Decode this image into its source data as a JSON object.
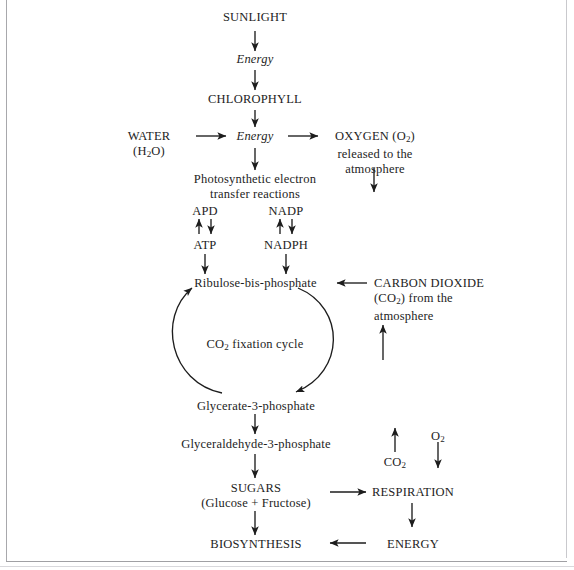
{
  "diagram": {
    "nodes": {
      "sunlight": "SUNLIGHT",
      "energy_top": "Energy",
      "chlorophyll": "CHLOROPHYLL",
      "water_line1": "WATER",
      "water_line2": "(H₂O)",
      "energy_mid": "Energy",
      "oxygen_line1": "OXYGEN (O₂)",
      "oxygen_line2": "released to the",
      "oxygen_line3": "atmosphere",
      "pser_line1": "Photosynthetic electron",
      "pser_line2": "transfer reactions",
      "apd": "APD",
      "atp": "ATP",
      "nadp": "NADP",
      "nadph": "NADPH",
      "ribulose": "Ribulose-bis-phosphate",
      "carbon_dioxide_line1": "CARBON DIOXIDE",
      "carbon_dioxide_line2": "(CO₂) from the",
      "carbon_dioxide_line3": "atmosphere",
      "cycle_label": "CO₂ fixation cycle",
      "glycerate": "Glycerate-3-phosphate",
      "glyceraldehyde": "Glyceraldehyde-3-phosphate",
      "sugars_line1": "SUGARS",
      "sugars_line2": "(Glucose + Fructose)",
      "biosynthesis": "BIOSYNTHESIS",
      "respiration": "RESPIRATION",
      "energy_bottom": "ENERGY",
      "co2_resp": "CO₂",
      "o2_resp": "O₂"
    },
    "colors": {
      "ink": "#1d1d1d",
      "frame": "#a8a8ac",
      "background": "#ffffff"
    },
    "edges": [
      {
        "name": "sunlight-to-energy",
        "type": "arrow-down"
      },
      {
        "name": "energy-to-chlorophyll",
        "type": "arrow-down"
      },
      {
        "name": "chlorophyll-to-energy-mid",
        "type": "arrow-down"
      },
      {
        "name": "water-to-energy-mid",
        "type": "arrow-right"
      },
      {
        "name": "energy-mid-to-oxygen",
        "type": "arrow-right"
      },
      {
        "name": "energy-mid-to-reactions",
        "type": "arrow-down"
      },
      {
        "name": "oxygen-out",
        "type": "arrow-down"
      },
      {
        "name": "apd-atp-up",
        "type": "arrow-up"
      },
      {
        "name": "apd-atp-down",
        "type": "arrow-down"
      },
      {
        "name": "nadp-nadph-up",
        "type": "arrow-up"
      },
      {
        "name": "nadp-nadph-down",
        "type": "arrow-down"
      },
      {
        "name": "atp-to-ribulose",
        "type": "arrow-down"
      },
      {
        "name": "nadph-to-ribulose",
        "type": "arrow-down"
      },
      {
        "name": "co2-to-ribulose",
        "type": "arrow-left"
      },
      {
        "name": "atmosphere-to-co2",
        "type": "arrow-up"
      },
      {
        "name": "cycle-left-arc",
        "type": "arc-up"
      },
      {
        "name": "cycle-right-arc",
        "type": "arc-down"
      },
      {
        "name": "glycerate-to-glyceraldehyde",
        "type": "arrow-down"
      },
      {
        "name": "glyceraldehyde-to-sugars",
        "type": "arrow-down"
      },
      {
        "name": "sugars-to-biosynthesis",
        "type": "arrow-down"
      },
      {
        "name": "sugars-to-respiration",
        "type": "arrow-right"
      },
      {
        "name": "respiration-to-energy",
        "type": "arrow-down"
      },
      {
        "name": "energy-to-biosynthesis",
        "type": "arrow-left"
      },
      {
        "name": "co2-released-up",
        "type": "arrow-up"
      },
      {
        "name": "o2-consumed-down",
        "type": "arrow-down"
      }
    ]
  }
}
